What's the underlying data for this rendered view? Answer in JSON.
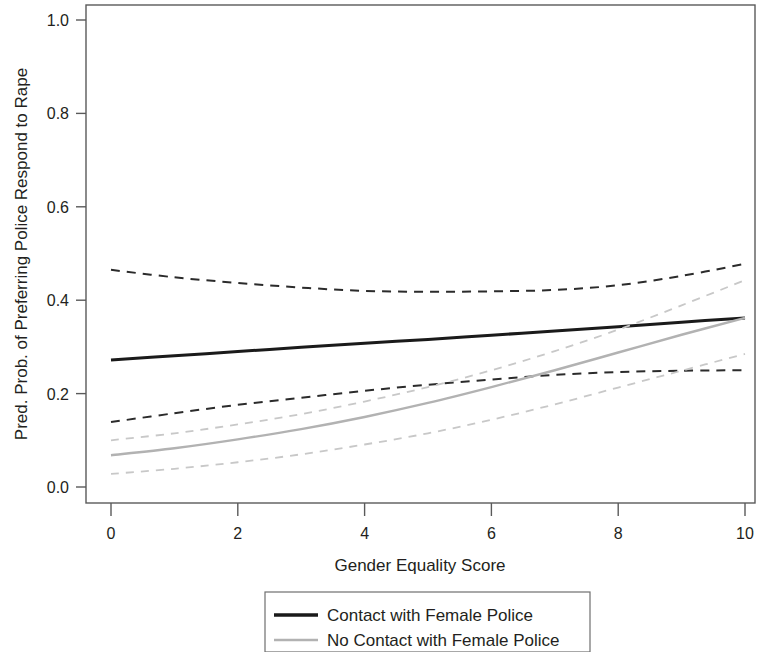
{
  "chart_data": {
    "type": "line",
    "title": "",
    "subtitle": "",
    "xlabel": "Gender Equality Score",
    "ylabel": "Pred. Prob. of Preferring Police Respond to Rape",
    "xlim": [
      0,
      10
    ],
    "ylim": [
      0,
      1.0
    ],
    "xticks": [
      0,
      2,
      4,
      6,
      8,
      10
    ],
    "xticklabels": [
      "0",
      "2",
      "4",
      "6",
      "8",
      "10"
    ],
    "yticks": [
      0.0,
      0.2,
      0.4,
      0.6,
      0.8,
      1.0
    ],
    "yticklabels": [
      "0.0",
      "0.2",
      "0.4",
      "0.6",
      "0.8",
      "1.0"
    ],
    "grid": false,
    "legend_position": "below-center",
    "x": [
      0,
      1,
      2,
      3,
      4,
      5,
      6,
      7,
      8,
      9,
      10
    ],
    "series": [
      {
        "name": "Contact with Female Police",
        "style": "solid",
        "color": "#1a1a1a",
        "width": 3.0,
        "values": [
          0.272,
          0.281,
          0.29,
          0.299,
          0.308,
          0.316,
          0.325,
          0.334,
          0.343,
          0.353,
          0.362
        ]
      },
      {
        "name": "Contact with Female Police CI upper",
        "style": "dashed",
        "color": "#2b2b2b",
        "width": 2.0,
        "values": [
          0.465,
          0.449,
          0.437,
          0.427,
          0.42,
          0.418,
          0.419,
          0.422,
          0.432,
          0.452,
          0.478
        ]
      },
      {
        "name": "Contact with Female Police CI lower",
        "style": "dashed",
        "color": "#2b2b2b",
        "width": 2.0,
        "values": [
          0.139,
          0.158,
          0.176,
          0.191,
          0.206,
          0.219,
          0.23,
          0.24,
          0.246,
          0.249,
          0.25
        ]
      },
      {
        "name": "No Contact with Female Police",
        "style": "solid",
        "color": "#b2b2b2",
        "width": 2.4,
        "values": [
          0.068,
          0.083,
          0.102,
          0.124,
          0.15,
          0.18,
          0.214,
          0.25,
          0.288,
          0.326,
          0.362
        ]
      },
      {
        "name": "No Contact with Female Police CI upper",
        "style": "dashed",
        "color": "#c8c8c8",
        "width": 1.8,
        "values": [
          0.1,
          0.115,
          0.134,
          0.156,
          0.183,
          0.214,
          0.25,
          0.291,
          0.337,
          0.389,
          0.443
        ]
      },
      {
        "name": "No Contact with Female Police CI lower",
        "style": "dashed",
        "color": "#c8c8c8",
        "width": 1.8,
        "values": [
          0.028,
          0.039,
          0.053,
          0.07,
          0.091,
          0.115,
          0.144,
          0.177,
          0.213,
          0.249,
          0.285
        ]
      }
    ],
    "legend_entries": [
      {
        "label": "Contact with Female Police",
        "color": "#1a1a1a",
        "style": "solid",
        "width": 3.4
      },
      {
        "label": "No Contact with Female Police",
        "color": "#b2b2b2",
        "style": "solid",
        "width": 2.4
      }
    ]
  }
}
